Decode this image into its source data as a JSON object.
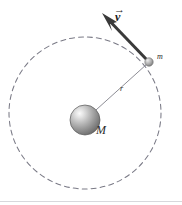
{
  "figure": {
    "background_color": "#ffffff",
    "width": 182,
    "height": 205
  },
  "labels": {
    "central_mass": "M",
    "orbiting_mass": "m",
    "radius": "r",
    "velocity_symbol": "v",
    "velocity_accent": "→"
  },
  "colors": {
    "orbit_stroke": "#7a7a86",
    "radius_stroke": "#8d8d95",
    "vector_stroke": "#3a3a3a",
    "sphere_light": "#f2f2f2",
    "sphere_mid": "#b4b4b4",
    "sphere_dark": "#6e6e6e",
    "sphere_edge": "#575757",
    "small_sphere_light": "#e6e6e6",
    "small_sphere_dark": "#7d7d7d",
    "label_color": "#2b2b2b",
    "baseline_rule": "#d8d8dc"
  },
  "chart_data": {
    "type": "scatter",
    "xlabel": "",
    "ylabel": "",
    "xlim": [
      0,
      182
    ],
    "ylim": [
      205,
      0
    ],
    "grid": false,
    "legend": null,
    "orbit": {
      "shape": "circle",
      "center_x": 85,
      "center_y": 113,
      "radius": 76,
      "stroke_style": "dashed",
      "dash_pattern": "5 4",
      "stroke_width": 1
    },
    "central_body": {
      "label": "M",
      "center_x": 85,
      "center_y": 120,
      "radius": 15,
      "fill": "radial-gradient",
      "highlight_x": 78,
      "highlight_y": 112
    },
    "orbiting_body": {
      "label": "m",
      "center_x": 149,
      "center_y": 62,
      "radius": 4.2,
      "label_x": 160,
      "label_y": 59
    },
    "radius_vector": {
      "label": "r",
      "from_x": 85,
      "from_y": 120,
      "to_x": 147,
      "to_y": 64,
      "label_x": 123,
      "label_y": 90,
      "stroke_width": 1
    },
    "velocity_vector": {
      "label": "v",
      "tail_x": 148,
      "tail_y": 61,
      "head_x": 103,
      "head_y": 14,
      "direction_deg": 133,
      "label_x": 120,
      "label_y": 18,
      "stroke_width": 3,
      "arrowhead": true,
      "tangent_to_orbit": true
    },
    "annotations": [
      {
        "text": "M",
        "x": 101,
        "y": 131,
        "style": "italic-serif"
      },
      {
        "text": "m",
        "x": 160,
        "y": 59,
        "style": "italic-serif"
      },
      {
        "text": "r",
        "x": 123,
        "y": 90,
        "style": "italic-serif"
      },
      {
        "text": "v",
        "x": 120,
        "y": 18,
        "style": "bold-italic-serif-with-vector-arrow"
      }
    ]
  }
}
